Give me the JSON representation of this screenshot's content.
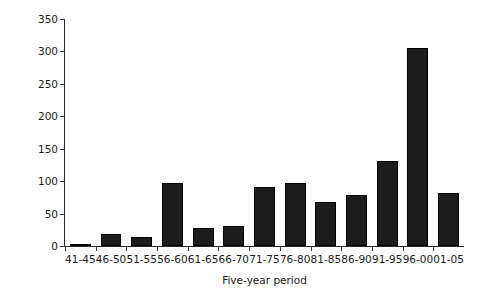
{
  "chart_data": {
    "type": "bar",
    "title": "",
    "xlabel": "Five-year period",
    "ylabel": "Number of birds",
    "categories": [
      "41-45",
      "46-50",
      "51-55",
      "56-60",
      "61-65",
      "66-70",
      "71-75",
      "76-80",
      "81-85",
      "86-90",
      "91-95",
      "96-00",
      "01-05"
    ],
    "values": [
      2,
      18,
      14,
      97,
      28,
      31,
      91,
      97,
      68,
      79,
      131,
      305,
      81
    ],
    "series": [
      {
        "name": "Number of birds",
        "values": [
          2,
          18,
          14,
          97,
          28,
          31,
          91,
          97,
          68,
          79,
          131,
          305,
          81
        ]
      }
    ],
    "ylim": [
      0,
      350
    ],
    "yticks": [
      0,
      50,
      100,
      150,
      200,
      250,
      300,
      350
    ],
    "ytick_labels": [
      "0",
      "50",
      "100",
      "150",
      "200",
      "250",
      "300",
      "350"
    ],
    "grid": false,
    "legend": false,
    "bar_color": "#1c1c1c",
    "axis_color": "#2b2b2b",
    "background": "#ffffff"
  },
  "axes": {
    "y_label": "Number of birds",
    "x_label": "Five-year period"
  },
  "ticks": {
    "y": [
      "350",
      "300",
      "250",
      "200",
      "150",
      "100",
      "50",
      "0"
    ],
    "x": [
      "41-45",
      "46-50",
      "51-55",
      "56-60",
      "61-65",
      "66-70",
      "71-75",
      "76-80",
      "81-85",
      "86-90",
      "91-95",
      "96-00",
      "01-05"
    ]
  }
}
